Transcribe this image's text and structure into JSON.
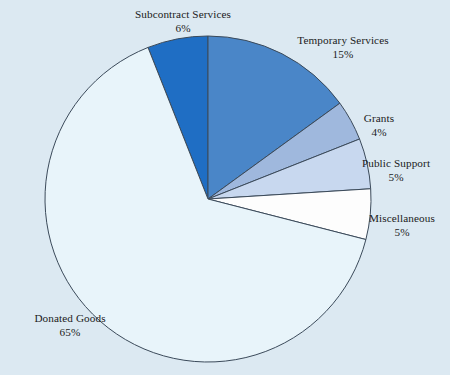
{
  "background_color": "#dce9f2",
  "outline_color": "#3b4a5a",
  "chart_data": {
    "type": "pie",
    "title": "",
    "subtitle": "",
    "xlabel": "",
    "ylabel": "",
    "legend_position": "none",
    "grid": false,
    "labels_outside": true,
    "unit": "%",
    "start_angle_deg": 0,
    "direction": "clockwise",
    "categories": [
      "Subcontract Services",
      "Temporary Services",
      "Grants",
      "Public Support",
      "Miscellaneous",
      "Donated Goods"
    ],
    "values": [
      6,
      15,
      4,
      5,
      5,
      65
    ],
    "value_labels": [
      "6%",
      "15%",
      "4%",
      "5%",
      "5%",
      "65%"
    ],
    "colors": [
      "#1f6ec4",
      "#4a86c8",
      "#9fb8dd",
      "#c8d8ef",
      "#fdfdfd",
      "#e8f4fa"
    ],
    "slices": [
      {
        "name": "Subcontract Services",
        "value": 6,
        "value_label": "6%",
        "color": "#1f6ec4",
        "start_deg": -21.6,
        "end_deg": 0
      },
      {
        "name": "Temporary Services",
        "value": 15,
        "value_label": "15%",
        "color": "#4a86c8",
        "start_deg": 0,
        "end_deg": 54
      },
      {
        "name": "Grants",
        "value": 4,
        "value_label": "4%",
        "color": "#9fb8dd",
        "start_deg": 54,
        "end_deg": 68.4
      },
      {
        "name": "Public Support",
        "value": 5,
        "value_label": "5%",
        "color": "#c8d8ef",
        "start_deg": 68.4,
        "end_deg": 86.4
      },
      {
        "name": "Miscellaneous",
        "value": 5,
        "value_label": "5%",
        "color": "#fdfdfd",
        "start_deg": 86.4,
        "end_deg": 104.4
      },
      {
        "name": "Donated Goods",
        "value": 65,
        "value_label": "65%",
        "color": "#e8f4fa",
        "start_deg": 104.4,
        "end_deg": 338.4
      }
    ]
  },
  "labels": {
    "subcontract_services": {
      "name": "Subcontract Services",
      "pct": "6%"
    },
    "temporary_services": {
      "name": "Temporary Services",
      "pct": "15%"
    },
    "grants": {
      "name": "Grants",
      "pct": "4%"
    },
    "public_support": {
      "name": "Public Support",
      "pct": "5%"
    },
    "miscellaneous": {
      "name": "Miscellaneous",
      "pct": "5%"
    },
    "donated_goods": {
      "name": "Donated Goods",
      "pct": "65%"
    }
  }
}
